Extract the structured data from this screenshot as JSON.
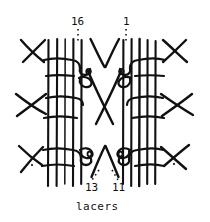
{
  "figure": {
    "stroke_color": "#111111",
    "background_color": "#ffffff"
  },
  "callouts": [
    {
      "id": "16",
      "text": "16",
      "position": "top-left",
      "leader": "dotted"
    },
    {
      "id": "1",
      "text": "1",
      "position": "top-right",
      "leader": "dotted"
    },
    {
      "id": "13",
      "text": "13",
      "position": "bottom-left",
      "leader": "dotted"
    },
    {
      "id": "11",
      "text": "11",
      "position": "bottom-right",
      "leader": "dotted"
    }
  ],
  "caption": {
    "text": "lacers"
  },
  "diagram": {
    "type": "line-drawing",
    "left_stake_x": [
      48,
      57,
      65,
      73,
      81
    ],
    "right_stake_x": [
      123,
      131,
      139,
      147,
      155
    ],
    "stake_top_y": 38,
    "stake_bottom_y": 186,
    "row_y": [
      62,
      110,
      152
    ],
    "center_x": 104
  }
}
